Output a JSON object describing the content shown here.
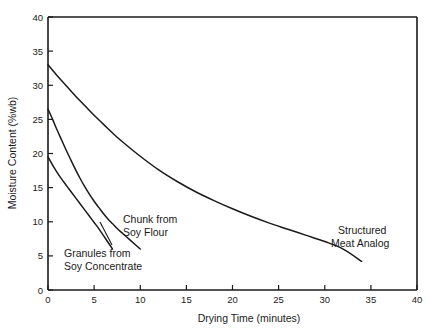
{
  "chart_data": {
    "type": "line",
    "title": "",
    "xlabel": "Drying Time (minutes)",
    "ylabel": "Moisture Content (%wb)",
    "xlim": [
      0,
      40
    ],
    "ylim": [
      0,
      40
    ],
    "xticks": [
      0,
      5,
      10,
      15,
      20,
      25,
      30,
      35,
      40
    ],
    "yticks": [
      0,
      5,
      10,
      15,
      20,
      25,
      30,
      35,
      40
    ],
    "xtick_labels": [
      "0",
      "5",
      "10",
      "15",
      "20",
      "25",
      "30",
      "35",
      "40"
    ],
    "ytick_labels": [
      "0",
      "5",
      "10",
      "15",
      "20",
      "25",
      "30",
      "35",
      "40"
    ],
    "grid": false,
    "legend_position": "inline-annotations",
    "line_color": "#1a1a1a",
    "background_color": "#ffffff",
    "series": [
      {
        "name": "Structured Meat Analog",
        "label_line1": "Structured",
        "label_line2": "Meat Analog",
        "x": [
          0,
          1,
          2,
          3,
          4,
          5,
          6,
          7,
          8,
          10,
          12,
          14,
          16,
          18,
          20,
          22,
          24,
          26,
          28,
          30,
          32,
          34
        ],
        "y": [
          33.0,
          31.4,
          29.9,
          28.4,
          27.0,
          25.6,
          24.3,
          23.0,
          21.8,
          19.6,
          17.6,
          15.9,
          14.4,
          13.1,
          11.9,
          10.8,
          9.8,
          8.9,
          8.0,
          7.1,
          6.0,
          4.2
        ]
      },
      {
        "name": "Chunk from Soy Flour",
        "label_line1": "Chunk from",
        "label_line2": "Soy Flour",
        "x": [
          0,
          0.5,
          1,
          1.5,
          2,
          2.5,
          3,
          3.5,
          4,
          4.5,
          5,
          5.5,
          6,
          6.5,
          7,
          7.5,
          8,
          8.5,
          9,
          9.5,
          10
        ],
        "y": [
          26.5,
          25.0,
          23.4,
          21.9,
          20.4,
          19.0,
          17.6,
          16.3,
          15.1,
          14.0,
          13.0,
          12.1,
          11.2,
          10.4,
          9.7,
          9.0,
          8.4,
          7.8,
          7.2,
          6.6,
          6.0
        ]
      },
      {
        "name": "Granules from Soy Concentrate",
        "label_line1": "Granules from",
        "label_line2": "Soy Concentrate",
        "x": [
          0,
          0.5,
          1,
          1.5,
          2,
          2.5,
          3,
          3.5,
          4,
          4.5,
          5,
          5.5,
          6,
          6.5,
          7
        ],
        "y": [
          19.5,
          18.3,
          17.2,
          16.2,
          15.3,
          14.4,
          13.5,
          12.6,
          11.7,
          10.8,
          9.9,
          9.0,
          8.0,
          7.0,
          6.0
        ]
      }
    ],
    "annotations": [
      {
        "id": "chunk-from-soy-flour",
        "line1": "Chunk from",
        "line2": "Soy Flour"
      },
      {
        "id": "granules-from-soy-concentrate",
        "line1": "Granules from",
        "line2": "Soy Concentrate"
      },
      {
        "id": "structured-meat-analog",
        "line1": "Structured",
        "line2": "Meat Analog"
      }
    ]
  }
}
